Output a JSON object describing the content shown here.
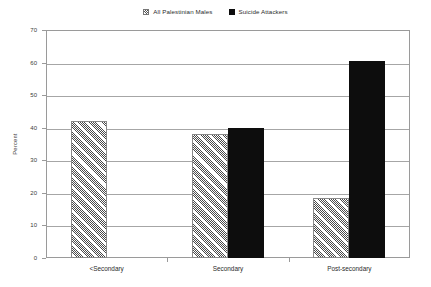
{
  "chart_data": {
    "type": "bar",
    "title": "",
    "subtitle": "",
    "xlabel": "",
    "ylabel": "Percent",
    "ylim": [
      0,
      70
    ],
    "ytick_step": 10,
    "yticks": [
      0,
      10,
      20,
      30,
      40,
      50,
      60,
      70
    ],
    "ytick_labels": [
      "0",
      "10",
      "20",
      "30",
      "40",
      "50",
      "60",
      "70"
    ],
    "grid": true,
    "grid_axis": "y",
    "legend_position": "top-center",
    "categories": [
      "<Secondary",
      "Secondary",
      "Post-secondary"
    ],
    "series": [
      {
        "name": "All Palestinian Males",
        "marker": "hatched-square",
        "fill": "diagonal-hatch",
        "color": "#4a4a4a",
        "values": [
          42,
          38,
          18.5
        ]
      },
      {
        "name": "Suicide Attackers",
        "marker": "filled-square",
        "fill": "solid",
        "color": "#0d0d0d",
        "values": [
          0,
          40,
          60.5
        ]
      }
    ],
    "annotations": []
  },
  "legend": {
    "entries": [
      {
        "label": "All Palestinian Males",
        "swatch": "hatched-square-icon"
      },
      {
        "label": "Suicide Attackers",
        "swatch": "filled-square-icon"
      }
    ]
  },
  "axes": {
    "y_title": "Percent",
    "y_tick_labels": [
      "70",
      "60",
      "50",
      "40",
      "30",
      "20",
      "10",
      "0"
    ],
    "x_tick_labels": [
      "<Secondary",
      "Secondary",
      "Post-secondary"
    ]
  },
  "colors": {
    "series_hatch": "#4a4a4a",
    "series_solid": "#0d0d0d",
    "gridline": "#a6a6a6",
    "frame": "#9a9a9a",
    "text": "#2b2b2b",
    "background": "#ffffff"
  }
}
